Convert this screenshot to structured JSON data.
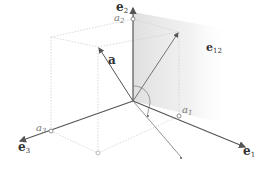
{
  "diagram": {
    "title": "",
    "vectors": {
      "e1": {
        "label": "e",
        "sub": "1"
      },
      "e2": {
        "label": "e",
        "sub": "2"
      },
      "e3": {
        "label": "e",
        "sub": "3"
      },
      "a": {
        "label": "a"
      }
    },
    "components": {
      "a1": {
        "label": "a",
        "sub": "1"
      },
      "a2": {
        "label": "a",
        "sub": "2"
      },
      "a3": {
        "label": "a",
        "sub": "3"
      }
    },
    "plane": {
      "label": "e",
      "sub": "12"
    },
    "colors": {
      "axis": "#666666",
      "box": "#cccccc",
      "plane_shade": "#e6e6e6",
      "text": "#333333"
    }
  }
}
